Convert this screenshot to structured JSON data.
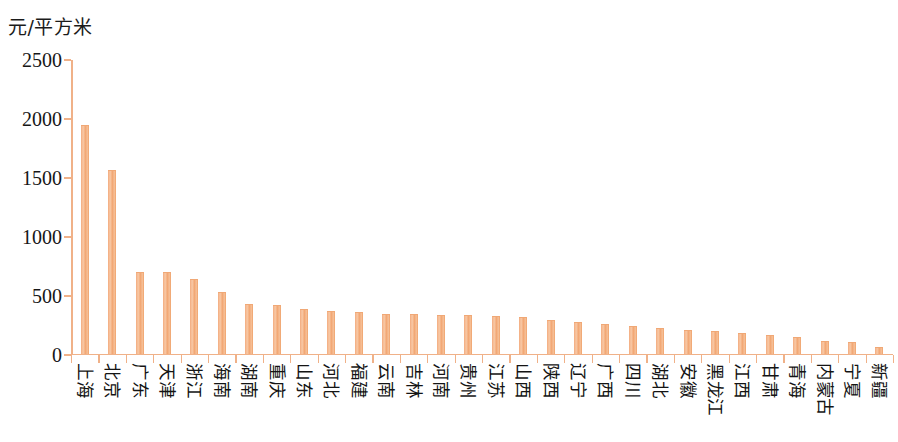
{
  "chart_data": {
    "type": "bar",
    "title": "",
    "subtitle": "",
    "xlabel": "",
    "ylabel": "元/平方米",
    "ylim": [
      0,
      2500
    ],
    "ytick_labels": [
      "2500",
      "2000",
      "1500",
      "1000",
      "500",
      "0"
    ],
    "ytick_values": [
      2500,
      2000,
      1500,
      1000,
      500,
      0
    ],
    "grid": false,
    "legend": null,
    "bar_color": "#f3ab7e",
    "axis_color": "#f0b188",
    "categories": [
      "上海",
      "北京",
      "广东",
      "天津",
      "浙江",
      "海南",
      "湖南",
      "重庆",
      "山东",
      "河北",
      "福建",
      "云南",
      "吉林",
      "河南",
      "贵州",
      "江苏",
      "山西",
      "陕西",
      "辽宁",
      "广西",
      "四川",
      "湖北",
      "安徽",
      "黑龙江",
      "江西",
      "甘肃",
      "青海",
      "内蒙古",
      "宁夏",
      "新疆"
    ],
    "values": [
      1930,
      1545,
      685,
      685,
      625,
      515,
      415,
      400,
      365,
      350,
      340,
      325,
      325,
      320,
      315,
      310,
      300,
      275,
      255,
      240,
      225,
      205,
      195,
      180,
      165,
      145,
      130,
      95,
      90,
      50
    ]
  }
}
